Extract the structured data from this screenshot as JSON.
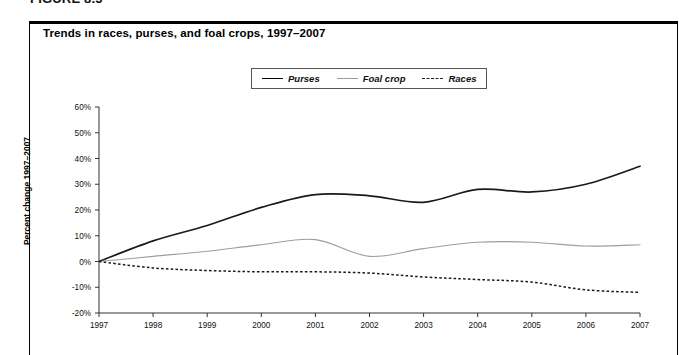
{
  "figure": {
    "label": "FIGURE 8.5",
    "title": "Trends in races, purses, and foal crops, 1997–2007"
  },
  "legend": {
    "position": "top-center",
    "items": [
      {
        "label": "Purses",
        "style": "solid-thick",
        "color": "#1a1a1a"
      },
      {
        "label": "Foal crop",
        "style": "solid-thin",
        "color": "#9e9e9e"
      },
      {
        "label": "Races",
        "style": "dashed",
        "color": "#1a1a1a"
      }
    ]
  },
  "axes": {
    "y_title": "Percent change 1997–2007",
    "y_ticks": [
      "60%",
      "50%",
      "40%",
      "30%",
      "20%",
      "10%",
      "0%",
      "-10%",
      "-20%"
    ],
    "x_ticks": [
      "1997",
      "1998",
      "1999",
      "2000",
      "2001",
      "2002",
      "2003",
      "2004",
      "2005",
      "2006",
      "2007"
    ]
  },
  "chart_data": {
    "type": "line",
    "title": "Trends in races, purses, and foal crops, 1997–2007",
    "xlabel": "",
    "ylabel": "Percent change 1997–2007",
    "x": [
      1997,
      1998,
      1999,
      2000,
      2001,
      2002,
      2003,
      2004,
      2005,
      2006,
      2007
    ],
    "categories": [
      "1997",
      "1998",
      "1999",
      "2000",
      "2001",
      "2002",
      "2003",
      "2004",
      "2005",
      "2006",
      "2007"
    ],
    "ylim": [
      -20,
      60
    ],
    "xlim": [
      1997,
      2007
    ],
    "ytick_step": 10,
    "grid": false,
    "legend_position": "top-center",
    "series": [
      {
        "name": "Purses",
        "values": [
          0,
          8,
          14,
          21,
          26,
          25.5,
          23,
          28,
          27,
          30,
          37
        ]
      },
      {
        "name": "Foal crop",
        "values": [
          0,
          2,
          4,
          6.5,
          8.5,
          2,
          5,
          7.5,
          7.5,
          6,
          6.5
        ]
      },
      {
        "name": "Races",
        "values": [
          0,
          -2.5,
          -3.5,
          -4,
          -4,
          -4.5,
          -6,
          -7,
          -8,
          -11,
          -12
        ]
      }
    ]
  }
}
